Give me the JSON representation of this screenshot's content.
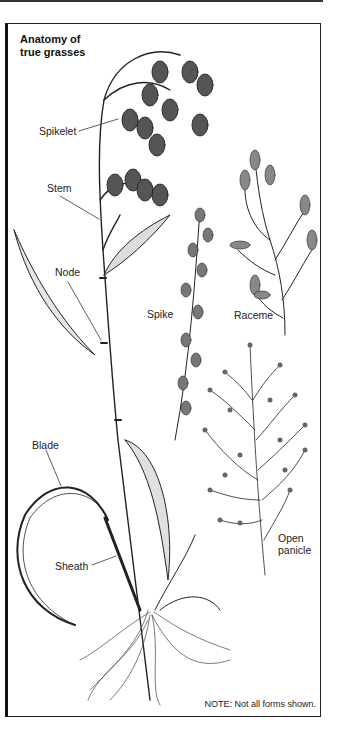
{
  "figure": {
    "title_line1": "Anatomy of",
    "title_line2": "true grasses",
    "labels": {
      "spikelet": "Spikelet",
      "stem": "Stem",
      "node": "Node",
      "blade": "Blade",
      "sheath": "Sheath",
      "spike": "Spike",
      "raceme": "Raceme",
      "open_panicle_line1": "Open",
      "open_panicle_line2": "panicle"
    },
    "note": "NOTE: Not all forms shown."
  }
}
